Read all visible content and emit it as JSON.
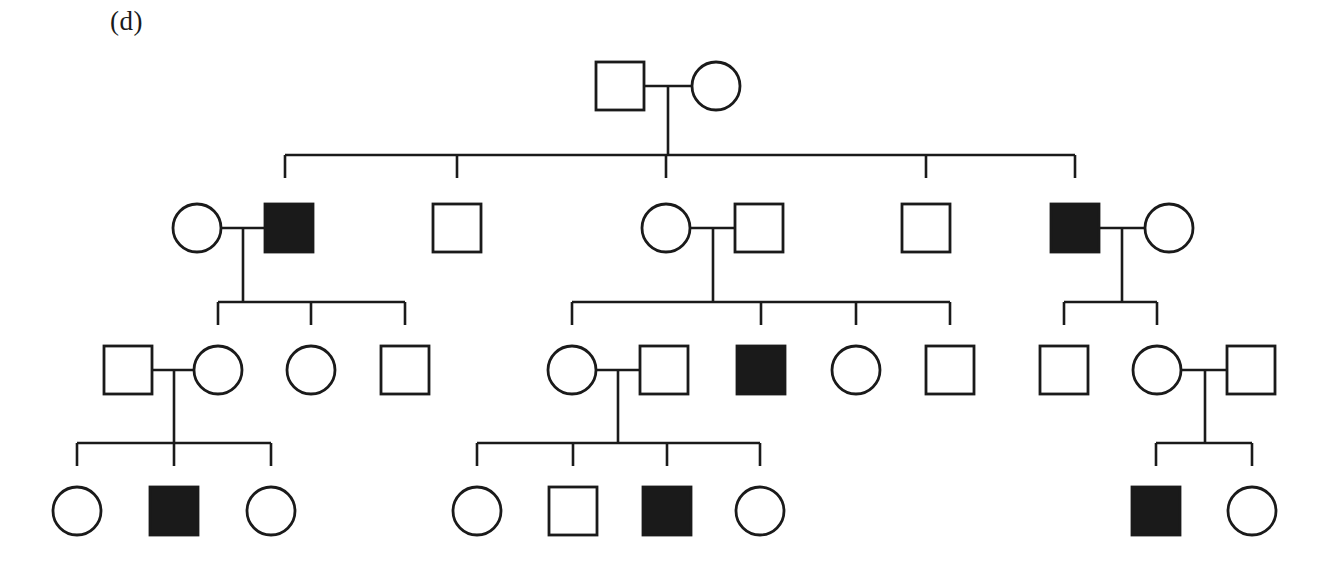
{
  "figure": {
    "panel_label": "(d)",
    "type": "pedigree-chart",
    "colors": {
      "stroke": "#1a1a1a",
      "affected_fill": "#1a1a1a",
      "unaffected_fill": "#ffffff",
      "background": "#ffffff"
    },
    "legend_semantics": {
      "square": "male",
      "circle": "female",
      "filled": "affected",
      "open": "unaffected"
    },
    "symbol_size": 48,
    "generations": [
      {
        "id": "I",
        "y": 86,
        "members": [
          {
            "id": "I-1",
            "sex": "male",
            "shape": "square",
            "affected": false,
            "cx": 620,
            "cy": 86
          },
          {
            "id": "I-2",
            "sex": "female",
            "shape": "circle",
            "affected": false,
            "cx": 716,
            "cy": 86
          }
        ]
      },
      {
        "id": "II",
        "y": 228,
        "members": [
          {
            "id": "II-1",
            "sex": "female",
            "shape": "circle",
            "affected": false,
            "cx": 197,
            "cy": 228,
            "role": "spouse"
          },
          {
            "id": "II-2",
            "sex": "male",
            "shape": "square",
            "affected": true,
            "cx": 289,
            "cy": 228,
            "role": "child"
          },
          {
            "id": "II-3",
            "sex": "male",
            "shape": "square",
            "affected": false,
            "cx": 457,
            "cy": 228,
            "role": "child"
          },
          {
            "id": "II-4",
            "sex": "female",
            "shape": "circle",
            "affected": false,
            "cx": 666,
            "cy": 228,
            "role": "child"
          },
          {
            "id": "II-5",
            "sex": "male",
            "shape": "square",
            "affected": false,
            "cx": 759,
            "cy": 228,
            "role": "spouse"
          },
          {
            "id": "II-6",
            "sex": "male",
            "shape": "square",
            "affected": false,
            "cx": 926,
            "cy": 228,
            "role": "child"
          },
          {
            "id": "II-7",
            "sex": "male",
            "shape": "square",
            "affected": true,
            "cx": 1075,
            "cy": 228,
            "role": "child"
          },
          {
            "id": "II-8",
            "sex": "female",
            "shape": "circle",
            "affected": false,
            "cx": 1169,
            "cy": 228,
            "role": "spouse"
          }
        ]
      },
      {
        "id": "III",
        "y": 370,
        "members": [
          {
            "id": "III-1",
            "sex": "male",
            "shape": "square",
            "affected": false,
            "cx": 128,
            "cy": 370,
            "role": "spouse"
          },
          {
            "id": "III-2",
            "sex": "female",
            "shape": "circle",
            "affected": false,
            "cx": 218,
            "cy": 370,
            "role": "child"
          },
          {
            "id": "III-3",
            "sex": "female",
            "shape": "circle",
            "affected": false,
            "cx": 311,
            "cy": 370,
            "role": "child"
          },
          {
            "id": "III-4",
            "sex": "male",
            "shape": "square",
            "affected": false,
            "cx": 405,
            "cy": 370,
            "role": "child"
          },
          {
            "id": "III-5",
            "sex": "female",
            "shape": "circle",
            "affected": false,
            "cx": 572,
            "cy": 370,
            "role": "child"
          },
          {
            "id": "III-6",
            "sex": "male",
            "shape": "square",
            "affected": false,
            "cx": 664,
            "cy": 370,
            "role": "spouse"
          },
          {
            "id": "III-7",
            "sex": "male",
            "shape": "square",
            "affected": true,
            "cx": 761,
            "cy": 370,
            "role": "child"
          },
          {
            "id": "III-8",
            "sex": "female",
            "shape": "circle",
            "affected": false,
            "cx": 856,
            "cy": 370,
            "role": "child"
          },
          {
            "id": "III-9",
            "sex": "male",
            "shape": "square",
            "affected": false,
            "cx": 950,
            "cy": 370,
            "role": "child"
          },
          {
            "id": "III-10",
            "sex": "male",
            "shape": "square",
            "affected": false,
            "cx": 1064,
            "cy": 370,
            "role": "child"
          },
          {
            "id": "III-11",
            "sex": "female",
            "shape": "circle",
            "affected": false,
            "cx": 1157,
            "cy": 370,
            "role": "child"
          },
          {
            "id": "III-12",
            "sex": "male",
            "shape": "square",
            "affected": false,
            "cx": 1251,
            "cy": 370,
            "role": "spouse"
          }
        ]
      },
      {
        "id": "IV",
        "y": 511,
        "members": [
          {
            "id": "IV-1",
            "sex": "female",
            "shape": "circle",
            "affected": false,
            "cx": 77,
            "cy": 511
          },
          {
            "id": "IV-2",
            "sex": "male",
            "shape": "square",
            "affected": true,
            "cx": 174,
            "cy": 511
          },
          {
            "id": "IV-3",
            "sex": "female",
            "shape": "circle",
            "affected": false,
            "cx": 271,
            "cy": 511
          },
          {
            "id": "IV-4",
            "sex": "female",
            "shape": "circle",
            "affected": false,
            "cx": 477,
            "cy": 511
          },
          {
            "id": "IV-5",
            "sex": "male",
            "shape": "square",
            "affected": false,
            "cx": 573,
            "cy": 511
          },
          {
            "id": "IV-6",
            "sex": "male",
            "shape": "square",
            "affected": true,
            "cx": 667,
            "cy": 511
          },
          {
            "id": "IV-7",
            "sex": "female",
            "shape": "circle",
            "affected": false,
            "cx": 760,
            "cy": 511
          },
          {
            "id": "IV-8",
            "sex": "male",
            "shape": "square",
            "affected": true,
            "cx": 1156,
            "cy": 511
          },
          {
            "id": "IV-9",
            "sex": "female",
            "shape": "circle",
            "affected": false,
            "cx": 1252,
            "cy": 511
          }
        ]
      }
    ],
    "counts": {
      "total_individuals": 41,
      "affected": 6,
      "affected_males": 6,
      "affected_females": 0,
      "males": 22,
      "females": 19
    },
    "lines": {
      "matings": [
        {
          "id": "mating-I",
          "x1": 644,
          "x2": 692,
          "y": 86
        },
        {
          "id": "mating-II-1",
          "x1": 221,
          "x2": 265,
          "y": 228
        },
        {
          "id": "mating-II-4",
          "x1": 690,
          "x2": 735,
          "y": 228
        },
        {
          "id": "mating-II-7",
          "x1": 1099,
          "x2": 1145,
          "y": 228
        },
        {
          "id": "mating-III-2",
          "x1": 152,
          "x2": 194,
          "y": 370
        },
        {
          "id": "mating-III-5",
          "x1": 596,
          "x2": 640,
          "y": 370
        },
        {
          "id": "mating-III-11",
          "x1": 1181,
          "x2": 1227,
          "y": 370
        }
      ],
      "sibships": [
        {
          "id": "sibship-II",
          "y": 155,
          "x1": 285,
          "x2": 1075,
          "drops": [
            285,
            457,
            666,
            926,
            1075
          ],
          "descent_x": 668,
          "descent_from_y": 86
        },
        {
          "id": "sibship-III-left",
          "y": 302,
          "x1": 218,
          "x2": 405,
          "drops": [
            218,
            311,
            405
          ],
          "descent_x": 243,
          "descent_from_y": 228
        },
        {
          "id": "sibship-III-mid",
          "y": 302,
          "x1": 572,
          "x2": 950,
          "drops": [
            572,
            761,
            856,
            950
          ],
          "descent_x": 713,
          "descent_from_y": 228
        },
        {
          "id": "sibship-III-right",
          "y": 302,
          "x1": 1064,
          "x2": 1157,
          "drops": [
            1064,
            1157
          ],
          "descent_x": 1122,
          "descent_from_y": 228
        },
        {
          "id": "sibship-IV-left",
          "y": 443,
          "x1": 77,
          "x2": 271,
          "drops": [
            77,
            174,
            271
          ],
          "descent_x": 174,
          "descent_from_y": 370
        },
        {
          "id": "sibship-IV-mid",
          "y": 443,
          "x1": 477,
          "x2": 760,
          "drops": [
            477,
            573,
            667,
            760
          ],
          "descent_x": 618,
          "descent_from_y": 370
        },
        {
          "id": "sibship-IV-right",
          "y": 443,
          "x1": 1156,
          "x2": 1252,
          "drops": [
            1156,
            1252
          ],
          "descent_x": 1205,
          "descent_from_y": 370
        }
      ]
    }
  }
}
